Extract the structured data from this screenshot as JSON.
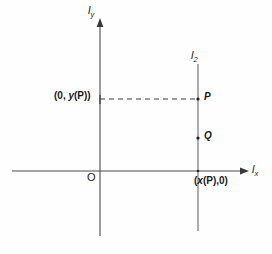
{
  "figure": {
    "type": "coordinate-geometry-diagram",
    "background_color": "#fefefe",
    "line_color": "#4a4a4a",
    "text_color": "#1a1a1a",
    "axes": {
      "y_axis": {
        "label": "l",
        "subscript": "y",
        "name": "vertical-axis"
      },
      "x_axis": {
        "label": "l",
        "subscript": "x",
        "name": "horizontal-axis"
      }
    },
    "vertical_line": {
      "label": "l",
      "subscript": "2"
    },
    "origin": {
      "label": "O"
    },
    "points": [
      {
        "label": "P",
        "name": "point-p"
      },
      {
        "label": "Q",
        "name": "point-q"
      }
    ],
    "coordinate_labels": {
      "y_projection": {
        "open": "(0, ",
        "var": "y",
        "close": "(P))"
      },
      "x_projection": {
        "open": "(",
        "var": "x",
        "close": "(P),0)"
      }
    },
    "dashed_connector": {
      "from": "y-axis",
      "to": "P"
    }
  }
}
